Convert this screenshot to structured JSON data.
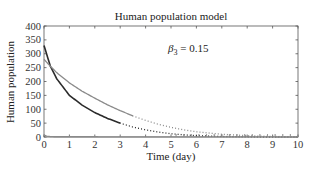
{
  "chart_data": {
    "type": "line",
    "title": "Human population model",
    "xlabel": "Time (day)",
    "ylabel": "Human population",
    "xlim": [
      0,
      10
    ],
    "ylim": [
      0,
      400
    ],
    "xticks": [
      0,
      1,
      2,
      3,
      4,
      5,
      6,
      7,
      8,
      9,
      10
    ],
    "yticks": [
      0,
      50,
      100,
      150,
      200,
      250,
      300,
      350,
      400
    ],
    "grid": false,
    "legend": null,
    "annotations": [
      {
        "text": "β3 = 0.15",
        "x": 3.9,
        "y": 315
      }
    ],
    "series": [
      {
        "name": "dark-curve",
        "color": "#2b2b2b",
        "x": [
          0,
          0.25,
          0.5,
          1,
          1.5,
          2,
          2.5,
          3,
          3.5,
          4,
          4.5,
          5,
          5.5,
          6,
          7,
          8,
          9,
          10
        ],
        "values": [
          330,
          255,
          210,
          150,
          115,
          88,
          67,
          50,
          36,
          26,
          18,
          12,
          8,
          5,
          2,
          1,
          0.5,
          0
        ]
      },
      {
        "name": "gray-curve",
        "color": "#8a8a8a",
        "x": [
          0,
          0.25,
          0.5,
          1,
          1.5,
          2,
          2.5,
          3,
          3.5,
          4,
          4.5,
          5,
          5.5,
          6,
          7,
          8,
          9,
          10
        ],
        "values": [
          280,
          255,
          232,
          195,
          165,
          140,
          116,
          95,
          76,
          60,
          46,
          35,
          26,
          19,
          10,
          5,
          2,
          1
        ]
      },
      {
        "name": "baseline-curve",
        "color": "#8a8a8a",
        "x": [
          0,
          0.1,
          0.3,
          10
        ],
        "values": [
          8,
          3,
          1,
          0
        ]
      }
    ]
  }
}
